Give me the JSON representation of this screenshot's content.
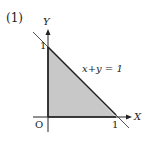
{
  "problem_label": "(1)",
  "axes": {
    "x_label": "X",
    "y_label": "Y",
    "origin_label": "O"
  },
  "ticks": {
    "x_one": "1",
    "y_one": "1"
  },
  "line": {
    "equation": "x+y = 1"
  },
  "region": {
    "description": "Shaded triangle with vertices (0,0), (1,0), (0,1)",
    "fill": "#c8c8c8"
  }
}
